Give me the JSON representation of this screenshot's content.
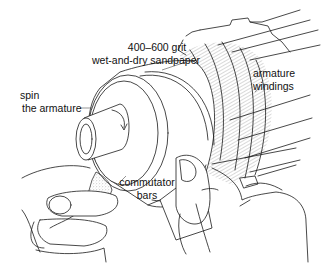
{
  "figure": {
    "labels": {
      "sandpaper": [
        "400–600 grit",
        "wet-and-dry sandpaper"
      ],
      "spin": [
        "spin",
        "the armature"
      ],
      "commutator": [
        "commutator",
        "bars"
      ],
      "windings": [
        "armature",
        "windings"
      ]
    },
    "colors": {
      "line": "#1a1a1a",
      "background": "#ffffff",
      "stipple": "#9a9a9a"
    }
  }
}
